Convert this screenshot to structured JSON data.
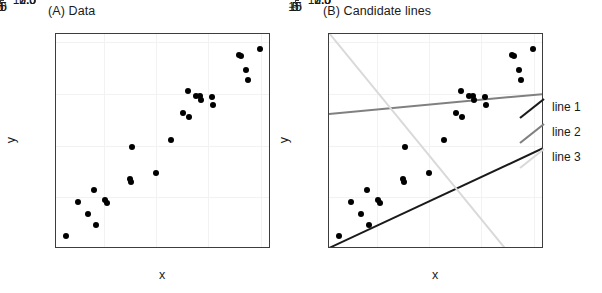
{
  "figure": {
    "width": 602,
    "height": 293,
    "background": "#ffffff"
  },
  "panels": [
    {
      "id": "a",
      "title": "(A) Data",
      "xlabel": "x",
      "ylabel": "y"
    },
    {
      "id": "b",
      "title": "(B) Candidate lines",
      "xlabel": "x",
      "ylabel": "y"
    }
  ],
  "legend": {
    "position": "right",
    "items": [
      {
        "label": "line 1",
        "color": "#1a1a1a"
      },
      {
        "label": "line 2",
        "color": "#808080"
      },
      {
        "label": "line 3",
        "color": "#d9d9d9"
      }
    ]
  },
  "chart_data": {
    "type": "scatter",
    "xlabel": "x",
    "ylabel": "y",
    "xlim": [
      -9.6,
      11.0
    ],
    "ylim": [
      0.0,
      10.4
    ],
    "xticks": [
      -5,
      0,
      5,
      10
    ],
    "xticklabels": [
      "−5",
      "0",
      "5",
      "10"
    ],
    "yticks": [
      2.5,
      5.0,
      7.5,
      10.0
    ],
    "yticklabels": [
      "2.5",
      "5.0",
      "7.5",
      "10.0"
    ],
    "grid": true,
    "point_color": "#000000",
    "points": [
      {
        "x": -8.6,
        "y": 0.65
      },
      {
        "x": -7.5,
        "y": 2.25
      },
      {
        "x": -6.5,
        "y": 1.7
      },
      {
        "x": -6.0,
        "y": 2.83
      },
      {
        "x": -5.8,
        "y": 1.15
      },
      {
        "x": -4.9,
        "y": 2.38
      },
      {
        "x": -4.7,
        "y": 2.22
      },
      {
        "x": -2.5,
        "y": 3.38
      },
      {
        "x": -2.4,
        "y": 3.22
      },
      {
        "x": -2.35,
        "y": 4.93
      },
      {
        "x": 0.0,
        "y": 3.68
      },
      {
        "x": 1.45,
        "y": 5.28
      },
      {
        "x": 2.6,
        "y": 6.6
      },
      {
        "x": 3.0,
        "y": 7.63
      },
      {
        "x": 3.1,
        "y": 6.38
      },
      {
        "x": 3.8,
        "y": 7.42
      },
      {
        "x": 4.15,
        "y": 7.38
      },
      {
        "x": 4.3,
        "y": 7.2
      },
      {
        "x": 5.3,
        "y": 7.35
      },
      {
        "x": 5.4,
        "y": 6.98
      },
      {
        "x": 7.9,
        "y": 9.4
      },
      {
        "x": 8.1,
        "y": 9.35
      },
      {
        "x": 8.6,
        "y": 8.65
      },
      {
        "x": 8.8,
        "y": 8.18
      },
      {
        "x": 9.9,
        "y": 9.68
      }
    ],
    "lines": [
      {
        "name": "line 1",
        "color": "#1a1a1a",
        "intercept": 2.38,
        "slope": 0.2353,
        "x_start": -9.6,
        "y_start": 0.12,
        "x_end": 11.0,
        "y_end": 4.97
      },
      {
        "name": "line 2",
        "color": "#808080",
        "intercept": 7.04,
        "slope": 0.0471,
        "x_start": -9.6,
        "y_start": 6.59,
        "x_end": 11.0,
        "y_end": 7.56
      },
      {
        "name": "line 3",
        "color": "#d9d9d9",
        "intercept": 4.55,
        "slope": -0.6176,
        "x_start": -9.6,
        "y_start": 10.48,
        "x_end": 11.0,
        "y_end": -2.24
      }
    ]
  }
}
